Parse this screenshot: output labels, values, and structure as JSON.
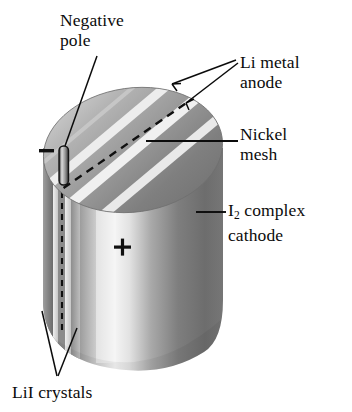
{
  "figure": {
    "kind": "cutaway-diagram",
    "palette": {
      "background": "#ffffff",
      "ink": "#0b0b0b",
      "top_face_light": "#b9b9b9",
      "top_face_dark": "#8a8a8a",
      "stripe_light": "#ececec",
      "body_dark": "#6e6e6e",
      "body_highlight": "#f2f2f2",
      "body_mid": "#a8a8a8",
      "edge_layer_dark": "#5f5f5f",
      "edge_layer_light": "#d8d8d8"
    }
  },
  "labels": {
    "negative_pole": "Negative\npole",
    "li_metal_anode": "Li metal\nanode",
    "nickel_mesh": "Nickel\nmesh",
    "i2_cathode_pre": "I",
    "i2_cathode_sub": "2",
    "i2_cathode_post": " complex\ncathode",
    "lii_crystals": "LiI crystals"
  },
  "markings": {
    "negative_sign": "–",
    "positive_sign": "+"
  },
  "leaders": {
    "negative_pole": {
      "from": [
        96,
        62
      ],
      "to": [
        62,
        152
      ]
    },
    "li_metal_anode_arrow_1": {
      "from": [
        236,
        58
      ],
      "to": [
        176,
        84
      ]
    },
    "li_metal_anode_arrow_2": {
      "from": [
        236,
        60
      ],
      "to": [
        190,
        100
      ]
    },
    "nickel_mesh": {
      "from": [
        238,
        142
      ],
      "to": [
        146,
        142
      ]
    },
    "i2_cathode": {
      "from": [
        226,
        213
      ],
      "to": [
        196,
        213
      ]
    },
    "lii_crystals_1": {
      "from": [
        56,
        376
      ],
      "to": [
        44,
        312
      ]
    },
    "lii_crystals_2": {
      "from": [
        58,
        376
      ],
      "to": [
        74,
        330
      ]
    }
  }
}
